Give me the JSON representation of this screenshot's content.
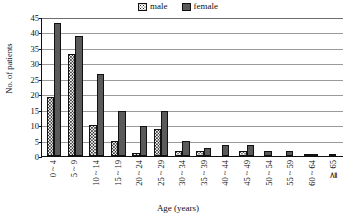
{
  "chart_data": {
    "type": "bar",
    "title": "",
    "xlabel": "Age (years)",
    "ylabel": "No. of patients",
    "ylim": [
      0,
      45
    ],
    "yticks": [
      0,
      5,
      10,
      15,
      20,
      25,
      30,
      35,
      40,
      45
    ],
    "grid": true,
    "legend_position": "top-center",
    "categories": [
      "0 ~ 4",
      "5 ~ 9",
      "10 ~ 14",
      "15 ~ 19",
      "20 ~ 24",
      "25 ~ 29",
      "30 ~ 34",
      "35 ~ 39",
      "40 ~ 44",
      "45 ~ 49",
      "50 ~ 54",
      "55 ~ 59",
      "60 ~ 64",
      "≧ 65"
    ],
    "series": [
      {
        "name": "male",
        "pattern": "dotted",
        "color": "#ffffff",
        "values": [
          19,
          33,
          10,
          5,
          1,
          8.7,
          1.6,
          1.6,
          0,
          1.6,
          0,
          0,
          0.7,
          0
        ]
      },
      {
        "name": "female",
        "pattern": "solid",
        "color": "#5a5a5a",
        "values": [
          43,
          39,
          26.5,
          14.7,
          9.7,
          14.7,
          4.8,
          2.6,
          3.6,
          3.6,
          1.5,
          1.5,
          0.7,
          0.7
        ]
      }
    ]
  },
  "legend": {
    "items": [
      {
        "label": "male"
      },
      {
        "label": "female"
      }
    ]
  },
  "colors": {
    "female_fill": "#5a5a5a",
    "male_fill": "#ffffff",
    "axis": "#111111",
    "gridline": "#9a9a9a"
  }
}
